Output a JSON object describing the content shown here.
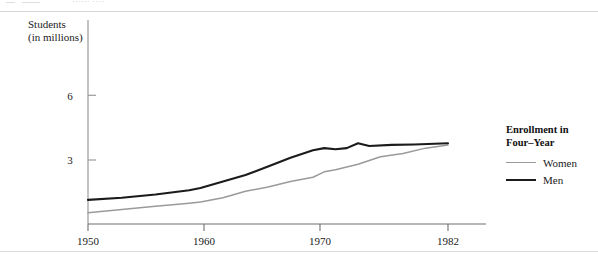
{
  "figure": {
    "cropped_header_fragments": [
      "—",
      "——",
      "······ ····"
    ]
  },
  "axis_title": {
    "line1": "Students",
    "line2": "(in millions)"
  },
  "legend": {
    "title_line1": "Enrollment in",
    "title_line2": "Four–Year",
    "entries": [
      {
        "label": "Women",
        "color": "#9a9a9a"
      },
      {
        "label": "Men",
        "color": "#1b1b1b"
      }
    ]
  },
  "chart_data": {
    "type": "line",
    "xlabel": "",
    "ylabel": "Students (in millions)",
    "xlim": [
      1950,
      1982
    ],
    "ylim": [
      0,
      7.3
    ],
    "xticks": [
      1950,
      1960,
      1970,
      1982
    ],
    "xtick_labels": [
      "1950",
      "1960",
      "1970",
      "1982"
    ],
    "yticks": [
      3,
      6
    ],
    "ytick_labels": [
      "3",
      "6"
    ],
    "grid": false,
    "legend_position": "right",
    "series": [
      {
        "name": "Men",
        "color": "#1b1b1b",
        "x": [
          1950,
          1953,
          1956,
          1959,
          1960,
          1962,
          1964,
          1966,
          1968,
          1970,
          1971,
          1972,
          1973,
          1974,
          1975,
          1977,
          1979,
          1982
        ],
        "values": [
          1.15,
          1.25,
          1.4,
          1.6,
          1.7,
          2.0,
          2.3,
          2.7,
          3.1,
          3.45,
          3.55,
          3.5,
          3.55,
          3.78,
          3.65,
          3.7,
          3.72,
          3.78
        ]
      },
      {
        "name": "Women",
        "color": "#9a9a9a",
        "x": [
          1950,
          1953,
          1956,
          1959,
          1960,
          1962,
          1964,
          1966,
          1968,
          1970,
          1971,
          1972,
          1974,
          1976,
          1978,
          1980,
          1982
        ],
        "values": [
          0.55,
          0.7,
          0.85,
          1.0,
          1.05,
          1.25,
          1.55,
          1.75,
          2.0,
          2.2,
          2.45,
          2.55,
          2.8,
          3.15,
          3.3,
          3.55,
          3.7
        ]
      }
    ]
  }
}
